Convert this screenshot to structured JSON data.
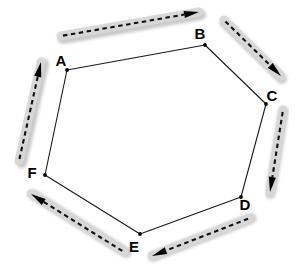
{
  "figure": {
    "background_color": "#ffffff",
    "width": 304,
    "height": 272
  },
  "style": {
    "polygon_edge_color": "#1a1a1a",
    "vertex_dot_color": "#000000",
    "label_color": "#000000",
    "band_fill_color": "#d8d8d8",
    "band_shadow_color": "#bfbfbf",
    "dash_line_color": "#111111",
    "arrow_head_color": "#000000"
  },
  "vertices": [
    {
      "id": "A",
      "label": "A",
      "x": 67,
      "y": 70,
      "label_x": 61,
      "label_y": 66
    },
    {
      "id": "B",
      "label": "B",
      "x": 205,
      "y": 45,
      "label_x": 200,
      "label_y": 39
    },
    {
      "id": "C",
      "label": "C",
      "x": 266,
      "y": 104,
      "label_x": 272,
      "label_y": 101
    },
    {
      "id": "D",
      "label": "D",
      "x": 241,
      "y": 197,
      "label_x": 245,
      "label_y": 210
    },
    {
      "id": "E",
      "label": "E",
      "x": 140,
      "y": 234,
      "label_x": 134,
      "label_y": 252
    },
    {
      "id": "F",
      "label": "F",
      "x": 45,
      "y": 175,
      "label_x": 32,
      "label_y": 178
    }
  ],
  "edges": [
    {
      "id": "AB",
      "from": "A",
      "to": "B"
    },
    {
      "id": "BC",
      "from": "B",
      "to": "C"
    },
    {
      "id": "CD",
      "from": "C",
      "to": "D"
    },
    {
      "id": "DE",
      "from": "D",
      "to": "E"
    },
    {
      "id": "EF",
      "from": "E",
      "to": "F"
    },
    {
      "id": "FA",
      "from": "F",
      "to": "A"
    }
  ],
  "circulation_arrows": [
    {
      "id": "arrow-ab",
      "along_edge": "AB",
      "direction": "A-to-B",
      "x1": 61,
      "y1": 36,
      "x2": 199,
      "y2": 12,
      "band_width": 9
    },
    {
      "id": "arrow-bc",
      "along_edge": "BC",
      "direction": "B-to-C",
      "x1": 224,
      "y1": 20,
      "x2": 281,
      "y2": 76,
      "band_width": 9
    },
    {
      "id": "arrow-cd",
      "along_edge": "CD",
      "direction": "C-to-D",
      "x1": 283,
      "y1": 110,
      "x2": 270,
      "y2": 192,
      "band_width": 9
    },
    {
      "id": "arrow-de",
      "along_edge": "DE",
      "direction": "D-to-E",
      "x1": 250,
      "y1": 218,
      "x2": 152,
      "y2": 256,
      "band_width": 9
    },
    {
      "id": "arrow-ef",
      "along_edge": "EF",
      "direction": "E-to-F",
      "x1": 124,
      "y1": 252,
      "x2": 31,
      "y2": 194,
      "band_width": 9
    },
    {
      "id": "arrow-fa",
      "along_edge": "FA",
      "direction": "F-to-A",
      "x1": 19,
      "y1": 161,
      "x2": 41,
      "y2": 62,
      "band_width": 9
    }
  ]
}
